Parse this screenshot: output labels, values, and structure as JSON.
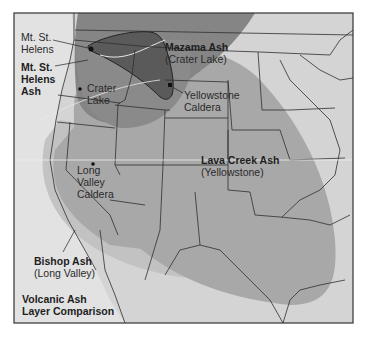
{
  "title": "Volcanic Ash Layer Comparison",
  "title_lines": [
    "Volcanic Ash",
    "Layer Comparison"
  ],
  "colors": {
    "background_land": "#cfcfcf",
    "lava_creek_layer": "#a9a9a9",
    "bishop_layer": "#bdbdbd",
    "mazama_layer": "#7f7f7f",
    "mt_st_helens_layer": "#555555",
    "state_borders": "#2b2b2b",
    "frame": "#333333"
  },
  "ash_layers": [
    {
      "id": "mt_st_helens",
      "name_lines": [
        "Mt. St.",
        "Helens",
        "Ash"
      ],
      "source": ""
    },
    {
      "id": "mazama",
      "name": "Mazama Ash",
      "source": "(Crater Lake)"
    },
    {
      "id": "lava_creek",
      "name": "Lava Creek Ash",
      "source": "(Yellowstone)"
    },
    {
      "id": "bishop",
      "name": "Bishop Ash",
      "source": "(Long Valley)"
    }
  ],
  "volcanoes": [
    {
      "id": "mt_st_helens",
      "label_lines": [
        "Mt. St.",
        "Helens"
      ]
    },
    {
      "id": "crater_lake",
      "label_lines": [
        "Crater",
        "Lake"
      ]
    },
    {
      "id": "yellowstone",
      "label_lines": [
        "Yellowstone",
        "Caldera"
      ]
    },
    {
      "id": "long_valley",
      "label_lines": [
        "Long",
        "Valley",
        "Caldera"
      ]
    }
  ]
}
